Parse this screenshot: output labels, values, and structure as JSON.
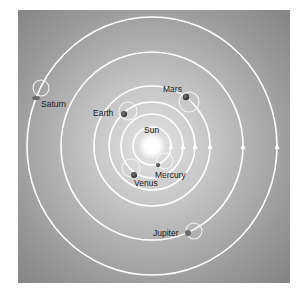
{
  "diagram": {
    "colors": {
      "background_outer": "#8c8c8c",
      "background_inner": "#d6d6d6",
      "orbit": "#ffffff",
      "sun": "#ffffff",
      "planet": "#3a3a3a",
      "label": "#1a1a1a"
    },
    "sun": {
      "label": "Sun",
      "cx": 152,
      "cy": 146
    },
    "labels": {
      "sun": "Sun",
      "mercury": "Mercury",
      "venus": "Venus",
      "earth": "Earth",
      "mars": "Mars",
      "jupiter": "Jupiter",
      "saturn": "Saturn"
    },
    "orbits": [
      {
        "planet": "Mercury",
        "rx": 19,
        "ry": 19
      },
      {
        "planet": "Venus",
        "rx": 31,
        "ry": 32
      },
      {
        "planet": "Earth",
        "rx": 43,
        "ry": 44
      },
      {
        "planet": "Mars",
        "rx": 58,
        "ry": 60
      },
      {
        "planet": "Jupiter",
        "rx": 91,
        "ry": 94
      },
      {
        "planet": "Saturn",
        "rx": 125,
        "ry": 129
      }
    ],
    "direction": "counterclockwise"
  }
}
